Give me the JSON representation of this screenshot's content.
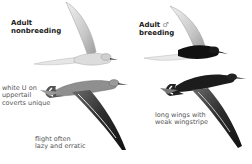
{
  "plates": {
    "nonbreeding": {
      "title_line1": "Adult",
      "title_line2": "nonbreeding"
    },
    "breeding": {
      "title_line1": "Adult",
      "sex_symbol": "♂",
      "title_line2": "breeding"
    }
  },
  "captions": {
    "uppertail": {
      "line1": "white U on",
      "line2": "uppertail",
      "line3": "coverts unique"
    },
    "flight": {
      "line1": "flight often",
      "line2": "lazy and erratic"
    },
    "wings": {
      "line1": "long wings with",
      "line2": "weak wingstripe"
    }
  },
  "colors": {
    "background": "#ffffff",
    "breeding_black": "#111111",
    "plumage_grey": "#8a8a8a",
    "wing_light": "#d9d9d9"
  }
}
